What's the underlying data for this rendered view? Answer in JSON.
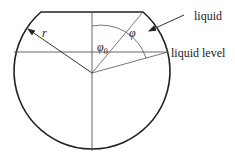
{
  "diagram": {
    "type": "tank cross-section (partially filled sphere/cylinder)",
    "labels": {
      "radius": "r",
      "liquid": "liquid",
      "liquid_level": "liquid level",
      "phi": "φ",
      "phi0": "φ",
      "phi0_sub": "0"
    },
    "colors": {
      "outline": "#222222",
      "thin_line": "#555555",
      "background": "#ffffff"
    }
  }
}
